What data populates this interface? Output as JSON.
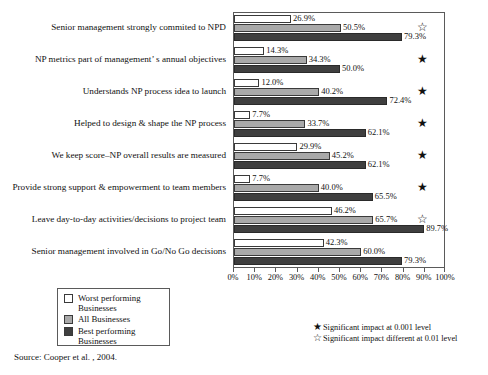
{
  "chart_data": {
    "type": "bar",
    "orientation": "horizontal",
    "title": "",
    "xlabel": "",
    "ylabel": "",
    "xlim": [
      0,
      100
    ],
    "grid": false,
    "legend_position": "bottom-left",
    "tick_labels": [
      "0%",
      "10%",
      "20%",
      "30%",
      "40%",
      "50%",
      "60%",
      "70%",
      "80%",
      "90%",
      "100%"
    ],
    "tick_values": [
      0,
      10,
      20,
      30,
      40,
      50,
      60,
      70,
      80,
      90,
      100
    ],
    "categories": [
      "Senior management strongly commited to NPD",
      "NP metrics part of management’ s annual objectives",
      "Understands NP process idea to launch",
      "Helped to design & shape the NP process",
      "We keep score–NP overall results are measured",
      "Provide strong support & empowerment to team members",
      "Leave day-to-day activities/decisions to project team",
      "Senior management involved in Go/No Go decisions"
    ],
    "series": [
      {
        "name": "Worst performing Businesses",
        "color": "#ffffff",
        "values": [
          26.9,
          14.3,
          12.0,
          7.7,
          29.9,
          7.7,
          46.2,
          42.3
        ],
        "labels": [
          "26.9%",
          "14.3%",
          "12.0%",
          "7.7%",
          "29.9%",
          "7.7%",
          "46.2%",
          "42.3%"
        ]
      },
      {
        "name": "All Businesses",
        "color": "#a9a9a9",
        "values": [
          50.5,
          34.3,
          40.2,
          33.7,
          45.2,
          40.0,
          65.7,
          60.0
        ],
        "labels": [
          "50.5%",
          "34.3%",
          "40.2%",
          "33.7%",
          "45.2%",
          "40.0%",
          "65.7%",
          "60.0%"
        ]
      },
      {
        "name": "Best performing Businesses",
        "color": "#3f3f3f",
        "values": [
          79.3,
          50.0,
          72.4,
          62.1,
          62.1,
          65.5,
          89.7,
          79.3
        ],
        "labels": [
          "79.3%",
          "50.0%",
          "72.4%",
          "62.1%",
          "62.1%",
          "65.5%",
          "89.7%",
          "79.3%"
        ]
      }
    ],
    "annotations": [
      {
        "category_index": 0,
        "marker": "☆",
        "marker_name": "open-star",
        "meaning": "Significant impact different at 0.01 level"
      },
      {
        "category_index": 1,
        "marker": "★",
        "marker_name": "filled-star",
        "meaning": "Significant impact at 0.001 level"
      },
      {
        "category_index": 2,
        "marker": "★",
        "marker_name": "filled-star",
        "meaning": "Significant impact at 0.001 level"
      },
      {
        "category_index": 3,
        "marker": "★",
        "marker_name": "filled-star",
        "meaning": "Significant impact at 0.001 level"
      },
      {
        "category_index": 4,
        "marker": "★",
        "marker_name": "filled-star",
        "meaning": "Significant impact at 0.001 level"
      },
      {
        "category_index": 5,
        "marker": "★",
        "marker_name": "filled-star",
        "meaning": "Significant impact at 0.001 level"
      },
      {
        "category_index": 6,
        "marker": "☆",
        "marker_name": "open-star",
        "meaning": "Significant impact different at 0.01 level"
      },
      {
        "category_index": 7,
        "marker": "",
        "marker_name": "none",
        "meaning": ""
      }
    ]
  },
  "legend": {
    "items": [
      {
        "label": "Worst performing Businesses",
        "color": "#ffffff"
      },
      {
        "label": "All Businesses",
        "color": "#a9a9a9"
      },
      {
        "label": "Best performing Businesses",
        "color": "#3f3f3f"
      }
    ]
  },
  "significance_note": {
    "rows": [
      {
        "symbol": "★",
        "text": "Significant impact at 0.001 level"
      },
      {
        "symbol": "☆",
        "text": "Significant impact different at 0.01 level"
      }
    ]
  },
  "source": {
    "text": "Source: Cooper et al. , 2004."
  }
}
